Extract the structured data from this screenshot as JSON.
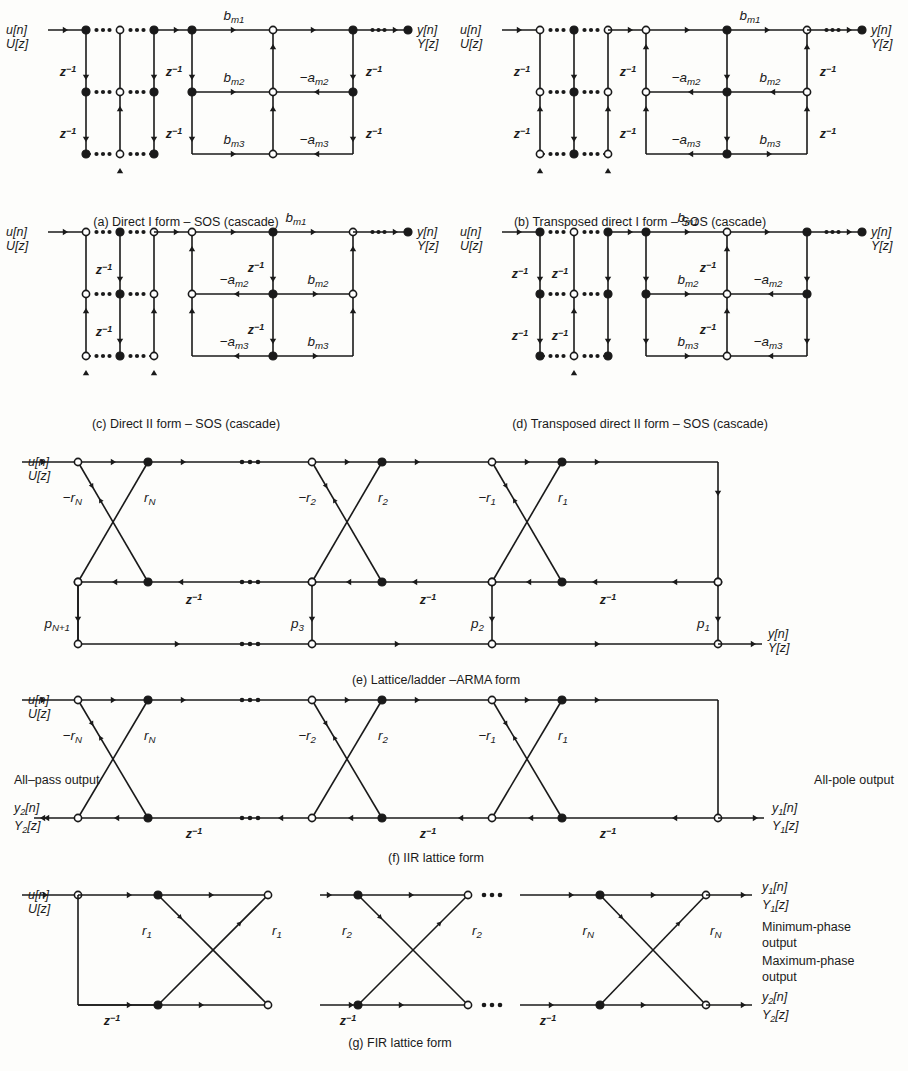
{
  "figure": {
    "panels": [
      {
        "id": "a",
        "caption": "(a) Direct I form – SOS (cascade)",
        "input_top": "u[n]",
        "input_bottom": "U[z]",
        "output_top": "y[n]",
        "output_bottom": "Y[z]",
        "delay_label": "z⁻¹",
        "coeffs": [
          "b",
          "m1",
          "b",
          "m2",
          "b",
          "m3",
          "−a",
          "m2",
          "−a",
          "m3"
        ],
        "feedforward": [
          {
            "base": "b",
            "sub": "m1"
          },
          {
            "base": "b",
            "sub": "m2"
          },
          {
            "base": "b",
            "sub": "m3"
          }
        ],
        "feedback": [
          {
            "base": "−a",
            "sub": "m2"
          },
          {
            "base": "−a",
            "sub": "m3"
          }
        ]
      },
      {
        "id": "b",
        "caption": "(b) Transposed direct I form – SOS (cascade)",
        "input_top": "u[n]",
        "input_bottom": "U[z]",
        "output_top": "y[n]",
        "output_bottom": "Y[z]",
        "delay_label": "z⁻¹",
        "feedforward": [
          {
            "base": "b",
            "sub": "m1"
          },
          {
            "base": "b",
            "sub": "m2"
          },
          {
            "base": "b",
            "sub": "m3"
          }
        ],
        "feedback": [
          {
            "base": "−a",
            "sub": "m2"
          },
          {
            "base": "−a",
            "sub": "m3"
          }
        ]
      },
      {
        "id": "c",
        "caption": "(c) Direct II form – SOS (cascade)",
        "input_top": "u[n]",
        "input_bottom": "U[z]",
        "output_top": "y[n]",
        "output_bottom": "Y[z]",
        "delay_label": "z⁻¹",
        "feedforward": [
          {
            "base": "b",
            "sub": "m1"
          },
          {
            "base": "b",
            "sub": "m2"
          },
          {
            "base": "b",
            "sub": "m3"
          }
        ],
        "feedback": [
          {
            "base": "−a",
            "sub": "m2"
          },
          {
            "base": "−a",
            "sub": "m3"
          }
        ]
      },
      {
        "id": "d",
        "caption": "(d) Transposed direct II form – SOS (cascade)",
        "input_top": "u[n]",
        "input_bottom": "U[z]",
        "output_top": "y[n]",
        "output_bottom": "Y[z]",
        "delay_label": "z⁻¹",
        "feedforward": [
          {
            "base": "b",
            "sub": "m1"
          },
          {
            "base": "b",
            "sub": "m2"
          },
          {
            "base": "b",
            "sub": "m3"
          }
        ],
        "feedback": [
          {
            "base": "−a",
            "sub": "m2"
          },
          {
            "base": "−a",
            "sub": "m3"
          }
        ]
      },
      {
        "id": "e",
        "caption": "(e) Lattice/ladder –ARMA form",
        "input_top": "u[n]",
        "input_bottom": "U[z]",
        "output_top": "y[n]",
        "output_bottom": "Y[z]",
        "delay_label": "z⁻¹",
        "reflection": [
          {
            "neg": "−r",
            "pos": "r",
            "sub": "N"
          },
          {
            "neg": "−r",
            "pos": "r",
            "sub": "2"
          },
          {
            "neg": "−r",
            "pos": "r",
            "sub": "1"
          }
        ],
        "ladder": [
          {
            "base": "p",
            "sub": "N+1"
          },
          {
            "base": "p",
            "sub": "3"
          },
          {
            "base": "p",
            "sub": "2"
          },
          {
            "base": "p",
            "sub": "1"
          }
        ]
      },
      {
        "id": "f",
        "caption": "(f) IIR lattice form",
        "input_top": "u[n]",
        "input_bottom": "U[z]",
        "delay_label": "z⁻¹",
        "left_note": "All–pass output",
        "right_note": "All-pole output",
        "left_out_top": "y",
        "left_out_top_sub": "2",
        "left_out_top_tail": "[n]",
        "left_out_bot": "Y",
        "left_out_bot_sub": "2",
        "left_out_bot_tail": "[z]",
        "right_out_top": "y",
        "right_out_top_sub": "1",
        "right_out_top_tail": "[n]",
        "right_out_bot": "Y",
        "right_out_bot_sub": "1",
        "right_out_bot_tail": "[z]",
        "reflection": [
          {
            "neg": "−r",
            "pos": "r",
            "sub": "N"
          },
          {
            "neg": "−r",
            "pos": "r",
            "sub": "2"
          },
          {
            "neg": "−r",
            "pos": "r",
            "sub": "1"
          }
        ]
      },
      {
        "id": "g",
        "caption": "(g) FIR lattice form",
        "input_top": "u[n]",
        "input_bottom": "U[z]",
        "delay_label": "z⁻¹",
        "note_min_1": "Minimum-phase",
        "note_min_2": "output",
        "note_max_1": "Maximum-phase",
        "note_max_2": "output",
        "out_top": "y",
        "out_top_sub": "1",
        "out_top_tail": "[n]",
        "out_top2": "Y",
        "out_top2_sub": "1",
        "out_top2_tail": "[z]",
        "out_bot": "y",
        "out_bot_sub": "2",
        "out_bot_tail": "[n]",
        "out_bot2": "Y",
        "out_bot2_sub": "2",
        "out_bot2_tail": "[z]",
        "reflection": [
          {
            "pos": "r",
            "sub": "1"
          },
          {
            "pos": "r",
            "sub": "2"
          },
          {
            "pos": "r",
            "sub": "N"
          }
        ]
      }
    ],
    "colors": {
      "ink": "#1a1a1a",
      "paper": "#fdfdfb",
      "node_fill_open": "#ffffff"
    }
  }
}
